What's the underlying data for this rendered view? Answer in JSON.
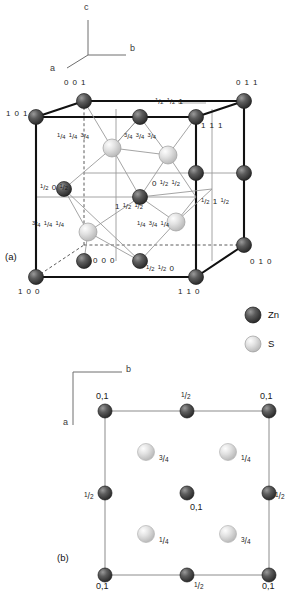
{
  "figure": {
    "panels": [
      {
        "tag": "(a)",
        "type": "unit-cell-3d"
      },
      {
        "tag": "(b)",
        "type": "projection-2d"
      }
    ]
  },
  "axes_a": {
    "c": "c",
    "b": "b",
    "a": "a"
  },
  "axes_b": {
    "b": "b",
    "a": "a"
  },
  "legend": [
    {
      "species": "Zn",
      "label": "Zn",
      "color": "#4a4a4a"
    },
    {
      "species": "S",
      "label": "S",
      "color": "#d4d4d4"
    }
  ],
  "panel_a": {
    "tag": "(a)",
    "corner_labels": [
      {
        "id": "c001",
        "text": "0 0 1"
      },
      {
        "id": "c011",
        "text": "0 1 1"
      },
      {
        "id": "c101",
        "text": "1 0 1"
      },
      {
        "id": "c111",
        "text": "1 1 1"
      },
      {
        "id": "c100",
        "text": "1 0 0"
      },
      {
        "id": "c110",
        "text": "1 1 0"
      },
      {
        "id": "c010",
        "text": "0 1 0"
      },
      {
        "id": "c000",
        "text": "0 0 0"
      }
    ],
    "zn_face_labels": [
      {
        "id": "zn-top",
        "n1": "1/2",
        "n2": "1/2",
        "n3": "1"
      },
      {
        "id": "zn-left",
        "n1": "1/2",
        "n2": "0",
        "n3": "1/2"
      },
      {
        "id": "zn-center",
        "n1": "0",
        "n2": "1/2",
        "n3": "1/2"
      },
      {
        "id": "zn-front",
        "n1": "1",
        "n2": "1/2",
        "n3": "1/2"
      },
      {
        "id": "zn-right",
        "n1": "1/2",
        "n2": "1",
        "n3": "1/2"
      },
      {
        "id": "zn-bottom",
        "n1": "1/2",
        "n2": "1/2",
        "n3": "0"
      }
    ],
    "s_labels": [
      {
        "id": "s-upper-left",
        "n1": "1/4",
        "n2": "1/4",
        "n3": "3/4"
      },
      {
        "id": "s-upper-right",
        "n1": "3/4",
        "n2": "3/4",
        "n3": "3/4"
      },
      {
        "id": "s-lower-left",
        "n1": "3/4",
        "n2": "1/4",
        "n3": "1/4"
      },
      {
        "id": "s-lower-right",
        "n1": "1/4",
        "n2": "3/4",
        "n3": "1/4"
      }
    ]
  },
  "panel_b": {
    "tag": "(b)",
    "zn_height_labels": [
      {
        "id": "tl",
        "text": "0,1"
      },
      {
        "id": "tm",
        "text": "1/2"
      },
      {
        "id": "tr",
        "text": "0,1"
      },
      {
        "id": "ml",
        "text": "1/2"
      },
      {
        "id": "mc",
        "text": "0,1"
      },
      {
        "id": "mr",
        "text": "1/2"
      },
      {
        "id": "bl",
        "text": "0,1"
      },
      {
        "id": "bm",
        "text": "1/2"
      },
      {
        "id": "br",
        "text": "0,1"
      }
    ],
    "s_height_labels": [
      {
        "id": "s-tl",
        "text": "3/4"
      },
      {
        "id": "s-tr",
        "text": "1/4"
      },
      {
        "id": "s-bl",
        "text": "1/4"
      },
      {
        "id": "s-br",
        "text": "3/4"
      }
    ]
  },
  "colors": {
    "zn_dark": "#4a4a4a",
    "s_light": "#d9d9d9",
    "edge_bold": "#111111",
    "edge_thin": "#8c8c8c",
    "text": "#111111"
  }
}
